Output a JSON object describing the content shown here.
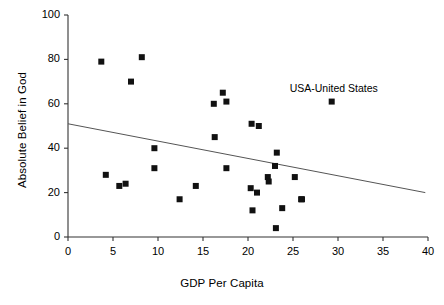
{
  "chart_data": {
    "type": "scatter",
    "title": "",
    "xlabel": "GDP Per Capita",
    "ylabel": "Absolute Belief in God",
    "xlim": [
      0,
      40
    ],
    "ylim": [
      0,
      100
    ],
    "xticks": [
      0,
      5,
      10,
      15,
      20,
      25,
      30,
      35,
      40
    ],
    "yticks": [
      0,
      20,
      40,
      60,
      80,
      100
    ],
    "grid": false,
    "legend": null,
    "marker": {
      "shape": "square",
      "color": "#111111",
      "size": 6
    },
    "points": [
      {
        "x": 3.7,
        "y": 79
      },
      {
        "x": 8.2,
        "y": 81
      },
      {
        "x": 7.0,
        "y": 70
      },
      {
        "x": 4.2,
        "y": 28
      },
      {
        "x": 5.7,
        "y": 23
      },
      {
        "x": 6.4,
        "y": 24
      },
      {
        "x": 9.6,
        "y": 40
      },
      {
        "x": 9.6,
        "y": 31
      },
      {
        "x": 12.4,
        "y": 17
      },
      {
        "x": 14.2,
        "y": 23
      },
      {
        "x": 16.2,
        "y": 60
      },
      {
        "x": 17.2,
        "y": 65
      },
      {
        "x": 17.6,
        "y": 61
      },
      {
        "x": 16.3,
        "y": 45
      },
      {
        "x": 17.6,
        "y": 31
      },
      {
        "x": 20.4,
        "y": 51
      },
      {
        "x": 21.2,
        "y": 50
      },
      {
        "x": 23.2,
        "y": 38
      },
      {
        "x": 23.0,
        "y": 32
      },
      {
        "x": 22.2,
        "y": 27
      },
      {
        "x": 22.3,
        "y": 25
      },
      {
        "x": 25.2,
        "y": 27
      },
      {
        "x": 20.3,
        "y": 22
      },
      {
        "x": 21.0,
        "y": 20
      },
      {
        "x": 26.0,
        "y": 17
      },
      {
        "x": 20.5,
        "y": 12
      },
      {
        "x": 23.8,
        "y": 13
      },
      {
        "x": 25.9,
        "y": 17
      },
      {
        "x": 23.1,
        "y": 4
      },
      {
        "x": 29.3,
        "y": 61
      }
    ],
    "annotations": [
      {
        "text": "USA-United States",
        "x": 29.3,
        "y": 61,
        "position": "above"
      }
    ],
    "trendline": {
      "type": "linear",
      "x0": 0,
      "y0": 51,
      "x1": 39.7,
      "y1": 20,
      "color": "#555555"
    }
  }
}
